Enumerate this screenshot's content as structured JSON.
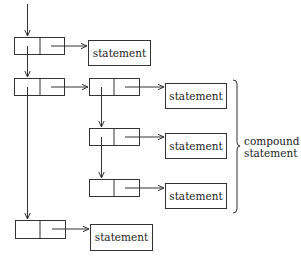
{
  "diagram": {
    "type": "linked-list statement structure",
    "nodes": [
      {
        "id": "c1",
        "kind": "cell",
        "x": 14,
        "y": 37,
        "w": 50,
        "h": 17
      },
      {
        "id": "c2",
        "kind": "cell",
        "x": 14,
        "y": 78,
        "w": 50,
        "h": 17
      },
      {
        "id": "c3",
        "kind": "cell",
        "x": 89,
        "y": 78,
        "w": 50,
        "h": 17
      },
      {
        "id": "c4",
        "kind": "cell",
        "x": 89,
        "y": 128,
        "w": 50,
        "h": 17
      },
      {
        "id": "c5",
        "kind": "cell",
        "x": 89,
        "y": 179,
        "w": 50,
        "h": 17
      },
      {
        "id": "c6",
        "kind": "cell",
        "x": 15,
        "y": 220,
        "w": 50,
        "h": 18
      }
    ],
    "statements": [
      {
        "id": "s1",
        "label": "statement",
        "x": 88,
        "y": 40,
        "w": 62,
        "h": 25
      },
      {
        "id": "s2",
        "label": "statement",
        "x": 165,
        "y": 83,
        "w": 61,
        "h": 25
      },
      {
        "id": "s3",
        "label": "statement",
        "x": 165,
        "y": 133,
        "w": 61,
        "h": 25
      },
      {
        "id": "s4",
        "label": "statement",
        "x": 165,
        "y": 183,
        "w": 61,
        "h": 25
      },
      {
        "id": "s5",
        "label": "statement",
        "x": 90,
        "y": 224,
        "w": 62,
        "h": 26
      }
    ],
    "brace": {
      "label_line1": "compound",
      "label_line2": "statement"
    },
    "colors": {
      "line": "#333333",
      "text": "#222222"
    }
  }
}
